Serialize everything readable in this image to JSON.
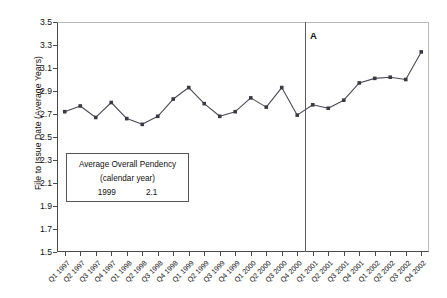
{
  "chart_data": {
    "type": "line",
    "title": "",
    "xlabel": "",
    "ylabel": "File to Issue Date (Average Years)",
    "ylim": [
      1.5,
      3.5
    ],
    "ytick_step": 0.2,
    "grid": false,
    "legend_position": "none",
    "marker": "square",
    "series_color": "#4a4a55",
    "marker_color": "#3a3a45",
    "categories": [
      "Q1 1997",
      "Q2 1997",
      "Q3 1997",
      "Q4 1997",
      "Q1 1998",
      "Q2 1998",
      "Q3 1998",
      "Q4 1998",
      "Q1 1999",
      "Q2 1999",
      "Q3 1999",
      "Q4 1999",
      "Q1 2000",
      "Q2 2000",
      "Q3 2000",
      "Q4 2000",
      "Q1 2001",
      "Q2 2001",
      "Q3 2001",
      "Q4 2001",
      "Q1 2002",
      "Q2 2002",
      "Q3 2002",
      "Q4 2002"
    ],
    "yticks": [
      "1.5",
      "1.7",
      "1.9",
      "2.1",
      "2.3",
      "2.5",
      "2.7",
      "2.9",
      "3.1",
      "3.3",
      "3.5"
    ],
    "series": [
      {
        "name": "File to Issue Date",
        "values": [
          2.72,
          2.77,
          2.67,
          2.8,
          2.66,
          2.61,
          2.68,
          2.83,
          2.93,
          2.79,
          2.68,
          2.72,
          2.84,
          2.76,
          2.93,
          2.69,
          2.78,
          2.75,
          2.82,
          2.97,
          3.01,
          3.02,
          3.0,
          3.24
        ]
      }
    ],
    "annotations": [
      {
        "name": "reference-line",
        "label": "A",
        "type": "vertical-line",
        "x_between": [
          "Q4 2000",
          "Q1 2001"
        ]
      }
    ],
    "textbox": {
      "line1": "Average Overall Pendency",
      "line2": "(calendar year)",
      "year": "1999",
      "value": "2.1"
    }
  }
}
